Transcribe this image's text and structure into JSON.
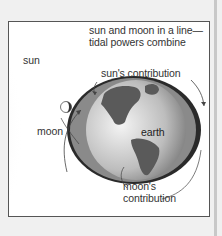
{
  "diagram": {
    "title_line1": "sun and moon in a line—",
    "title_line2": "tidal powers combine",
    "labels": {
      "sun": "sun",
      "moon": "moon",
      "earth": "earth",
      "sun_contribution": "sun's contribution",
      "moon_contribution_line1": "moon's",
      "moon_contribution_line2": "contribution"
    },
    "colors": {
      "background": "#f0f0f0",
      "frame_border": "#555555",
      "tidal_bulge": "#2a2a2a",
      "land": "#5a5a5a",
      "ocean": "#d8d8d8"
    }
  }
}
